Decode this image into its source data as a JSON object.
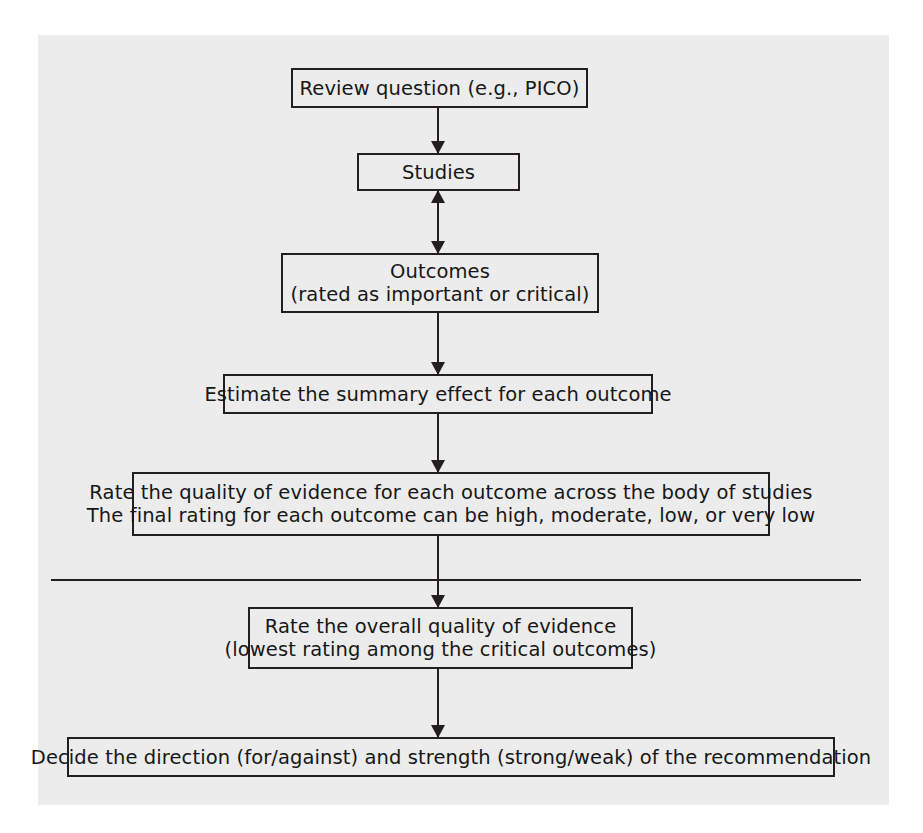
{
  "figure": {
    "background_color": "#ececec",
    "line_color": "#231f20",
    "page_color": "#ffffff"
  },
  "nodes": [
    {
      "id": "review-question",
      "lines": [
        "Review question (e.g., PICO)"
      ]
    },
    {
      "id": "studies",
      "lines": [
        "Studies"
      ]
    },
    {
      "id": "outcomes",
      "lines": [
        "Outcomes",
        "(rated as important or critical)"
      ]
    },
    {
      "id": "estimate-summary-effect",
      "lines": [
        "Estimate the summary effect for each outcome"
      ]
    },
    {
      "id": "rate-quality-of-evidence",
      "lines": [
        "Rate the quality of evidence for each outcome across the body of studies",
        "The final rating for each outcome can be high, moderate, low, or very low"
      ]
    },
    {
      "id": "rate-overall-quality",
      "lines": [
        "Rate the overall quality of evidence",
        "(lowest rating among the critical outcomes)"
      ]
    },
    {
      "id": "decide-recommendation",
      "lines": [
        "Decide the direction (for/against) and strength (strong/weak) of the recommendation"
      ]
    }
  ],
  "connectors": [
    {
      "id": "review-to-studies",
      "direction": "down"
    },
    {
      "id": "studies-to-outcomes",
      "direction": "both"
    },
    {
      "id": "outcomes-to-estimate",
      "direction": "down"
    },
    {
      "id": "estimate-to-rate-quality",
      "direction": "down"
    },
    {
      "id": "rate-quality-to-overall",
      "direction": "down"
    },
    {
      "id": "overall-to-decide",
      "direction": "down"
    }
  ],
  "divider": {
    "id": "section-divider",
    "description": "horizontal rule separating evidence rating from recommendation"
  }
}
